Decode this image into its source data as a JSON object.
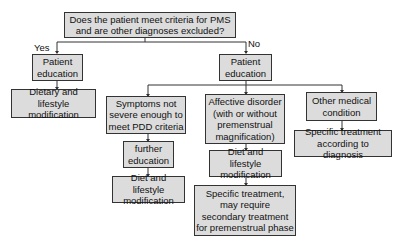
{
  "flowchart": {
    "root": "Does the patient meet criteria for PMS\nand are other diagnoses excluded?",
    "yes_label": "Yes",
    "no_label": "No",
    "yes_branch": {
      "education": "Patient\neducation",
      "modification": "Dietary and lifestyle\nmodification"
    },
    "no_branch": {
      "education": "Patient\neducation",
      "mild": {
        "condition": "Symptoms not\nsevere enough to\nmeet PDD criteria",
        "education": "further\neducation",
        "modification": "Diet and lifestyle\nmodification"
      },
      "affective": {
        "condition": "Affective disorder\n(with or without\npremenstrual\nmagnification)",
        "modification": "Diet and lifestyle\nmodification",
        "treatment": "Specific treatment,\nmay require\nsecondary treatment\nfor premenstrual phase"
      },
      "other": {
        "condition": "Other medical\ncondition",
        "treatment": "Specific treatment\naccording to diagnosis"
      }
    }
  }
}
